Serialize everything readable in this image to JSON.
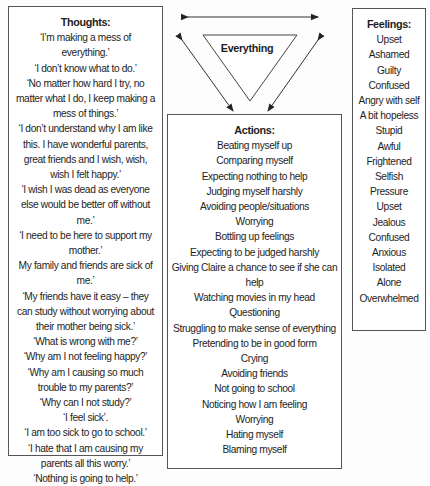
{
  "center": {
    "label": "Everything"
  },
  "thoughts": {
    "title": "Thoughts:",
    "items": [
      "‘I’m making a mess of everything.’",
      "‘I don’t know what to do.’",
      "‘No matter how hard I try, no matter what I do, I keep making a mess of things.’",
      "‘I don’t understand why I am like this. I have wonderful parents, great friends and I wish, wish, wish I felt happy.’",
      "‘I wish I was dead as everyone else would be better off without me.’",
      "‘I need to be here to support my mother.’",
      "My family and friends are sick of me.’",
      "‘My friends have it easy – they can study without worrying about their mother being sick.’",
      "‘What is wrong with me?’",
      "‘Why am I not feeling happy?’",
      "‘Why am I causing so much trouble to my parents?’",
      "‘Why can I not study?’",
      "‘I feel sick’.",
      "‘I am too sick to go to school.’",
      "‘I hate that I am causing my parents all this worry.’",
      "‘Nothing is going to help.’"
    ]
  },
  "actions": {
    "title": "Actions:",
    "items": [
      "Beating myself up",
      "Comparing myself",
      "Expecting nothing to help",
      "Judging myself harshly",
      "Avoiding people/situations",
      "Worrying",
      "Bottling up feelings",
      "Expecting to be judged harshly",
      "Giving Claire a chance to see if she can help",
      "Watching movies in my head",
      "Questioning",
      "Struggling to make sense of everything",
      "Pretending to be in good form",
      "Crying",
      "Avoiding friends",
      "Not going to school",
      "Noticing how I am feeling",
      "Worrying",
      "Hating myself",
      "Blaming myself"
    ]
  },
  "feelings": {
    "title": "Feelings:",
    "items": [
      "Upset",
      "Ashamed",
      "Guilty",
      "Confused",
      "Angry with self",
      "A bit hopeless",
      "Stupid",
      "Awful",
      "Frightened",
      "Selfish",
      "Pressure",
      "Upset",
      "Jealous",
      "Confused",
      "Anxious",
      "Isolated",
      "Alone",
      "Overwhelmed"
    ]
  }
}
